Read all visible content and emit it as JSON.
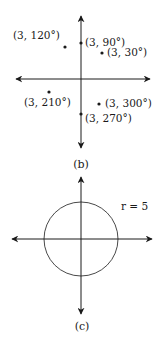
{
  "figure_b": {
    "caption": "(b)",
    "points": [
      {
        "label": "(3, 120°)",
        "r": 3,
        "theta_deg": 120
      },
      {
        "label": "(3, 90°)",
        "r": 3,
        "theta_deg": 90
      },
      {
        "label": "(3, 30°)",
        "r": 3,
        "theta_deg": 30
      },
      {
        "label": "(3, 210°)",
        "r": 3,
        "theta_deg": 210
      },
      {
        "label": "(3, 300°)",
        "r": 3,
        "theta_deg": 300
      },
      {
        "label": "(3, 270°)",
        "r": 3,
        "theta_deg": 270
      }
    ]
  },
  "figure_c": {
    "caption": "(c)",
    "circle_label": "r = 5",
    "radius": 5
  },
  "colors": {
    "ink": "#1a1a1a",
    "background": "#ffffff"
  }
}
